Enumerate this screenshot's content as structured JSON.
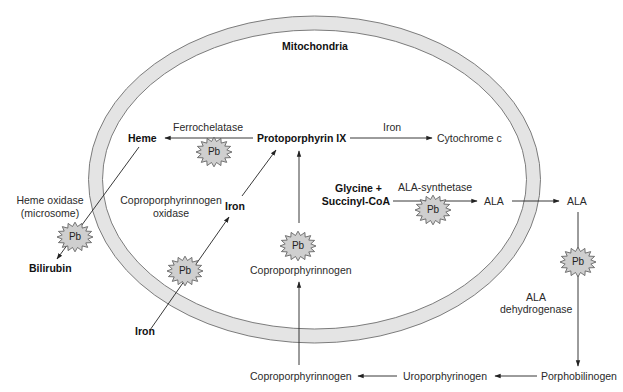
{
  "title": "Mitochondria",
  "colors": {
    "membrane_fill": "#e4e4e4",
    "membrane_stroke": "#6e6e6e",
    "pb_fill": "#cfcfcf",
    "pb_stroke": "#555555",
    "line": "#222222"
  },
  "nodes": {
    "heme": "Heme",
    "protoporphyrin": "Protoporphyrin IX",
    "cytochrome": "Cytochrome c",
    "glycine": "Glycine +",
    "succinyl": "Succinyl-CoA",
    "ala_inner": "ALA",
    "ala_outer": "ALA",
    "porphobilinogen": "Porphobilinogen",
    "uroporphyrinogen": "Uroporphyrinogen",
    "copro_outer": "Coproporphyrinnogen",
    "copro_inner": "Coproporphyrinnogen",
    "iron_inner": "Iron",
    "iron_outer": "Iron",
    "bilirubin": "Bilirubin"
  },
  "enzymes": {
    "ferrochelatase": "Ferrochelatase",
    "iron_to_cyt": "Iron",
    "ala_synthetase": "ALA-synthetase",
    "ala_dehydrogenase_1": "ALA",
    "ala_dehydrogenase_2": "dehydrogenase",
    "copro_oxidase_1": "Coproporphyrinnogen",
    "copro_oxidase_2": "oxidase",
    "heme_oxidase_1": "Heme oxidase",
    "heme_oxidase_2": "(microsome)"
  },
  "inhibitor": {
    "label": "Pb",
    "markers": [
      {
        "id": "ferrochelatase",
        "x": 214,
        "y": 152
      },
      {
        "id": "ala-synthetase",
        "x": 433,
        "y": 210
      },
      {
        "id": "ala-dehydrogenase",
        "x": 578,
        "y": 262
      },
      {
        "id": "copro-oxidase",
        "x": 298,
        "y": 246
      },
      {
        "id": "iron-transport",
        "x": 185,
        "y": 271
      },
      {
        "id": "heme-oxidase",
        "x": 75,
        "y": 237
      }
    ]
  }
}
